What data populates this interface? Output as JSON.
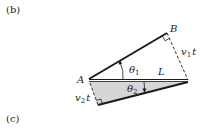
{
  "panels": {
    "b_label": "(b)",
    "c_label": "(c)"
  },
  "points": {
    "A": "A",
    "B": "B"
  },
  "labels": {
    "theta1": "θ",
    "theta1_sub": "1",
    "theta2": "θ",
    "theta2_sub": "2",
    "L": "L",
    "v1t_v": "v",
    "v1t_sub": "1",
    "v1t_t": "t",
    "v2t_v": "v",
    "v2t_sub": "2",
    "v2t_t": "t"
  },
  "colors": {
    "line": "#1a1a1a",
    "shade": "#d6d6d6",
    "text": "#222222"
  }
}
